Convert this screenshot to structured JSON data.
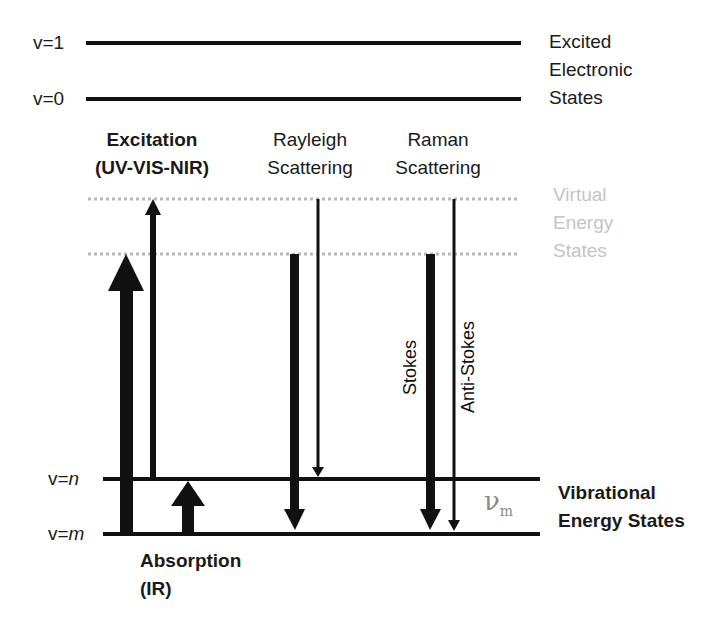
{
  "diagram": {
    "levels": {
      "electronic": [
        {
          "label": "v=1",
          "y": 43
        },
        {
          "label": "v=0",
          "y": 99
        }
      ],
      "virtual": [
        {
          "y": 199
        },
        {
          "y": 254
        }
      ],
      "vibrational": [
        {
          "label_prefix": "v=",
          "label_var": "n",
          "y": 479
        },
        {
          "label_prefix": "v=",
          "label_var": "m",
          "y": 534
        }
      ]
    },
    "group_labels": {
      "electronic": [
        "Excited",
        "Electronic",
        "States"
      ],
      "virtual": [
        "Virtual",
        "Energy",
        "States"
      ],
      "vibrational": [
        "Vibrational",
        "Energy States"
      ]
    },
    "columns": {
      "excitation": [
        "Excitation",
        "(UV-VIS-NIR)"
      ],
      "rayleigh": [
        "Rayleigh",
        "Scattering"
      ],
      "raman": [
        "Raman",
        "Scattering"
      ]
    },
    "absorption": [
      "Absorption",
      "(IR)"
    ],
    "arrow_labels": {
      "stokes": "Stokes",
      "anti_stokes": "Anti-Stokes"
    },
    "frequency_symbol": {
      "base": "ν",
      "sub": "m"
    },
    "arrows": [
      {
        "name": "excitation-thick-up",
        "x": 126,
        "from_y": 534,
        "to_y": 254,
        "weight": "thick",
        "direction": "up"
      },
      {
        "name": "excitation-thin-up",
        "x": 153,
        "from_y": 479,
        "to_y": 199,
        "weight": "thin",
        "direction": "up"
      },
      {
        "name": "absorption-ir-up",
        "x": 188,
        "from_y": 534,
        "to_y": 479,
        "weight": "thick",
        "direction": "up"
      },
      {
        "name": "rayleigh-thick-down",
        "x": 295,
        "from_y": 254,
        "to_y": 534,
        "weight": "thick",
        "direction": "down"
      },
      {
        "name": "rayleigh-thin-down",
        "x": 318,
        "from_y": 199,
        "to_y": 479,
        "weight": "thin",
        "direction": "down"
      },
      {
        "name": "raman-stokes-down",
        "x": 430,
        "from_y": 254,
        "to_y": 534,
        "weight": "thick",
        "direction": "down"
      },
      {
        "name": "raman-anti-stokes-down",
        "x": 454,
        "from_y": 199,
        "to_y": 534,
        "weight": "thin",
        "direction": "down"
      }
    ],
    "colors": {
      "line": "#111111",
      "virtual_dotted": "#b8b8b8",
      "virtual_text": "#c4c4c4",
      "nu_text": "#8a8a8a"
    }
  }
}
